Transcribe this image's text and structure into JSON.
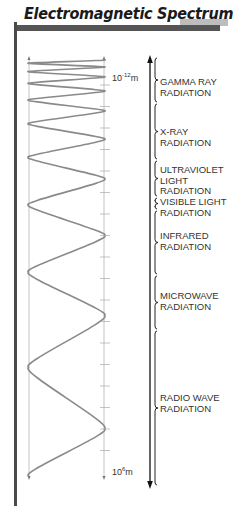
{
  "title": "Electromagnetic Spectrum",
  "scale": {
    "top_base": "10",
    "top_exp": "-12",
    "top_unit": "m",
    "bottom_base": "10",
    "bottom_exp": "6",
    "bottom_unit": "m"
  },
  "bands": [
    {
      "id": "gamma",
      "lines": [
        "GAMMA RAY",
        "RADIATION"
      ],
      "y0": 57,
      "y1": 103,
      "label_y": 77
    },
    {
      "id": "xray",
      "lines": [
        "X-RAY",
        "RADIATION"
      ],
      "y0": 103,
      "y1": 160,
      "label_y": 127
    },
    {
      "id": "uv",
      "lines": [
        "ULTRAVIOLET",
        "LIGHT",
        "RADIATION"
      ],
      "y0": 160,
      "y1": 197,
      "label_y": 165
    },
    {
      "id": "visible",
      "lines": [
        "VISIBLE LIGHT",
        "RADIATION"
      ],
      "y0": 197,
      "y1": 210,
      "label_y": 197
    },
    {
      "id": "infrared",
      "lines": [
        "INFRARED",
        "RADIATION"
      ],
      "y0": 210,
      "y1": 275,
      "label_y": 231
    },
    {
      "id": "microwave",
      "lines": [
        "MICROWAVE",
        "RADIATION"
      ],
      "y0": 275,
      "y1": 330,
      "label_y": 291
    },
    {
      "id": "radio",
      "lines": [
        "RADIO WAVE",
        "RADIATION"
      ],
      "y0": 330,
      "y1": 486,
      "label_y": 393
    }
  ],
  "colors": {
    "wave": "#8a8a8a",
    "guide": "#b0b0b0",
    "arrow": "#111111",
    "bar": "#555555"
  }
}
